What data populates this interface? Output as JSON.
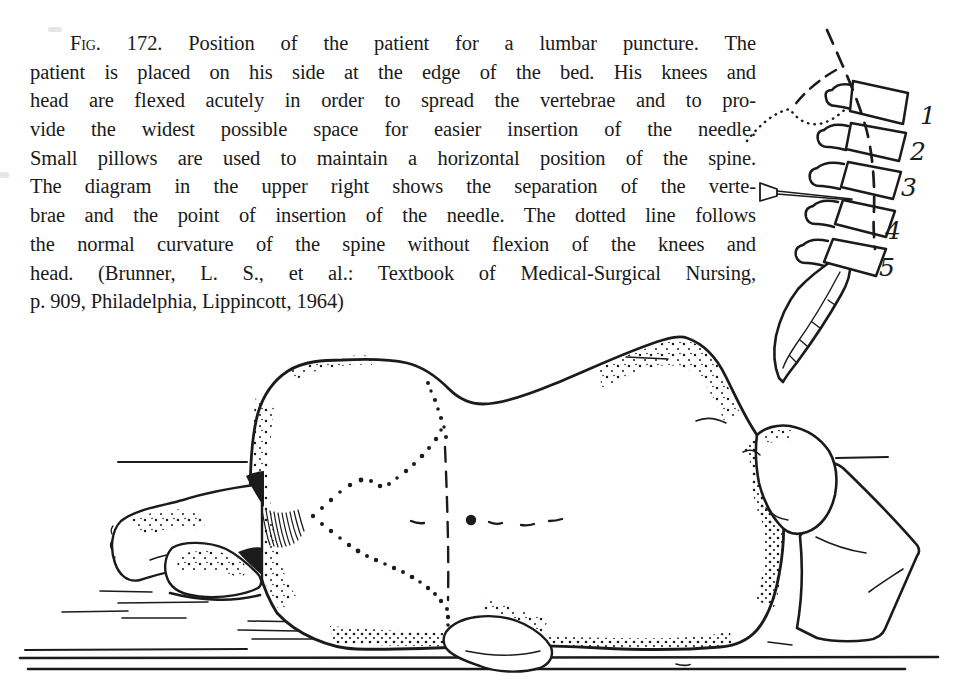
{
  "figure": {
    "caption": {
      "fig_label": "Fig.",
      "lines": [
        "172. Position of the patient for a lumbar puncture. The",
        "patient is placed on his side at the edge of the bed. His knees and",
        "head are flexed acutely in order to spread the vertebrae and to pro-",
        "vide the widest possible space for easier insertion of the needle.",
        "Small pillows are used to maintain a horizontal position of the spine.",
        "The diagram in the upper right shows the separation of the verte-",
        "brae and the point of insertion of the needle. The dotted line follows",
        "the normal curvature of the spine without flexion of the knees and",
        "head. (Brunner, L. S., et al.: Textbook of Medical-Surgical Nursing,",
        "p. 909, Philadelphia, Lippincott, 1964)"
      ]
    },
    "spine_diagram": {
      "vertebra_labels": [
        "1",
        "2",
        "3",
        "4",
        "5"
      ]
    }
  },
  "colors": {
    "ink": "#1b1b1b",
    "paper": "#ffffff"
  }
}
